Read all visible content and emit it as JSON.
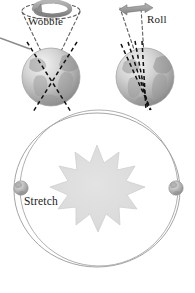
{
  "figure": {
    "background_color": "#ffffff",
    "width": 195,
    "height": 293
  },
  "labels": {
    "wobble": "Wobble",
    "roll": "Roll",
    "stretch": "Stretch"
  },
  "colors": {
    "text": "#1a1a1a",
    "dashed_axis": "#111111",
    "globe_light": "#f0f0f0",
    "globe_mid": "#b9b9b9",
    "globe_dark": "#8e8e8e",
    "sun_fill": "#dcdcdc",
    "sun_stroke": "#cfcfcf",
    "orbit_stroke": "#9a9a9a",
    "arrow_fill": "#9e9e9e",
    "arrow_stroke": "#707070",
    "pointer_line": "#8a8a8a",
    "cone_dash": "#6e6e6e"
  },
  "panels": {
    "wobble": {
      "name": "precession-panel",
      "label": "Wobble",
      "icon": "circular-rotation-arrow",
      "globe": "earth-globe-left",
      "axis_style": "crossed-dashed-axes",
      "axis_count": 2,
      "cone": "dashed-precession-cone"
    },
    "roll": {
      "name": "obliquity-panel",
      "label": "Roll",
      "icon": "double-headed-horizontal-arrow",
      "globe": "earth-globe-right",
      "axis_style": "tilted-parallel-dashed-axes",
      "axis_count": 4
    },
    "stretch": {
      "name": "eccentricity-panel",
      "label": "Stretch",
      "sun": "sun-starburst",
      "sun_points": 11,
      "orbits": [
        {
          "name": "circular-orbit",
          "shape": "near-circle"
        },
        {
          "name": "elliptical-orbit",
          "shape": "ellipse"
        }
      ],
      "earths": [
        {
          "name": "orbit-earth-left",
          "position": "left"
        },
        {
          "name": "orbit-earth-right",
          "position": "right"
        }
      ]
    }
  }
}
